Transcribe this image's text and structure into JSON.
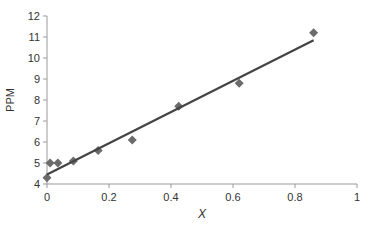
{
  "chart_data": {
    "type": "scatter",
    "title": "",
    "xlabel": "X",
    "ylabel": "PPM",
    "xlim": [
      0,
      1
    ],
    "ylim": [
      4,
      12
    ],
    "x_ticks": [
      "0",
      "0.2",
      "0.4",
      "0.6",
      "0.8",
      "1"
    ],
    "y_ticks": [
      "4",
      "5",
      "6",
      "7",
      "8",
      "9",
      "10",
      "11",
      "12"
    ],
    "grid": false,
    "legend": null,
    "series": [
      {
        "name": "data",
        "marker": "diamond",
        "color": "#6b6b6b",
        "x": [
          0.0,
          0.01,
          0.035,
          0.085,
          0.165,
          0.275,
          0.425,
          0.62,
          0.86
        ],
        "y": [
          4.3,
          5.0,
          5.0,
          5.1,
          5.6,
          6.1,
          7.7,
          8.8,
          11.2
        ]
      },
      {
        "name": "linear fit",
        "type": "line",
        "color": "#444444",
        "x": [
          0.0,
          0.86
        ],
        "y": [
          4.45,
          10.85
        ]
      }
    ]
  }
}
